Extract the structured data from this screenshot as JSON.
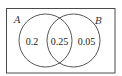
{
  "diagram": {
    "type": "venn",
    "universe": {
      "x": 6,
      "y": 8,
      "width": 109,
      "height": 65
    },
    "sets": [
      {
        "label": "A",
        "cx": 45.5,
        "cy": 40.5,
        "r": 26.5
      },
      {
        "label": "B",
        "cx": 73.5,
        "cy": 40.5,
        "r": 26.5
      }
    ],
    "regions": [
      {
        "name": "A only",
        "value": "0.2"
      },
      {
        "name": "A and B",
        "value": "0.25"
      },
      {
        "name": "B only",
        "value": "0.05"
      }
    ]
  },
  "colors": {
    "line": "#444444",
    "background": "#ffffff",
    "text": "#222222"
  }
}
